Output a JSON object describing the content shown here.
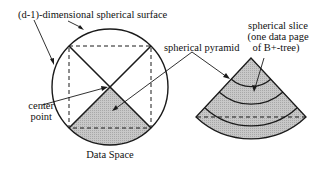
{
  "labels": {
    "surface": "(d-1)-dimensional spherical surface",
    "pyramid": "spherical pyramid",
    "center_line1": "center",
    "center_line2": "point",
    "data_space": "Data Space",
    "slice_line1": "spherical slice",
    "slice_line2": "(one data page",
    "slice_line3": "of B+-tree)"
  },
  "colors": {
    "stroke": "#1a1a1a",
    "fill": "#c4c4c4",
    "background": "#ffffff"
  }
}
